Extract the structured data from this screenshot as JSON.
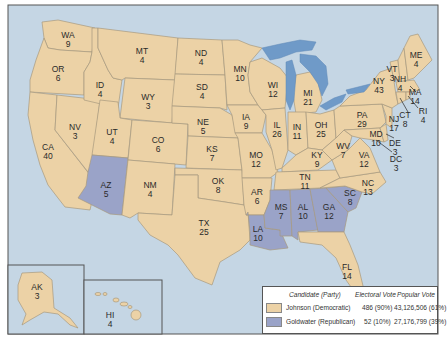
{
  "colors": {
    "ocean": "#c5d6e4",
    "democratic": "#ecd2a6",
    "republican": "#9aa3c8",
    "lakes": "#6f9ac8",
    "frame": "#555555"
  },
  "states": {
    "WA": {
      "abbr": "WA",
      "votes": "9",
      "winner": "Johnson"
    },
    "OR": {
      "abbr": "OR",
      "votes": "6",
      "winner": "Johnson"
    },
    "CA": {
      "abbr": "CA",
      "votes": "40",
      "winner": "Johnson"
    },
    "NV": {
      "abbr": "NV",
      "votes": "3",
      "winner": "Johnson"
    },
    "ID": {
      "abbr": "ID",
      "votes": "4",
      "winner": "Johnson"
    },
    "MT": {
      "abbr": "MT",
      "votes": "4",
      "winner": "Johnson"
    },
    "WY": {
      "abbr": "WY",
      "votes": "3",
      "winner": "Johnson"
    },
    "UT": {
      "abbr": "UT",
      "votes": "4",
      "winner": "Johnson"
    },
    "AZ": {
      "abbr": "AZ",
      "votes": "5",
      "winner": "Goldwater"
    },
    "CO": {
      "abbr": "CO",
      "votes": "6",
      "winner": "Johnson"
    },
    "NM": {
      "abbr": "NM",
      "votes": "4",
      "winner": "Johnson"
    },
    "ND": {
      "abbr": "ND",
      "votes": "4",
      "winner": "Johnson"
    },
    "SD": {
      "abbr": "SD",
      "votes": "4",
      "winner": "Johnson"
    },
    "NE": {
      "abbr": "NE",
      "votes": "5",
      "winner": "Johnson"
    },
    "KS": {
      "abbr": "KS",
      "votes": "7",
      "winner": "Johnson"
    },
    "OK": {
      "abbr": "OK",
      "votes": "8",
      "winner": "Johnson"
    },
    "TX": {
      "abbr": "TX",
      "votes": "25",
      "winner": "Johnson"
    },
    "MN": {
      "abbr": "MN",
      "votes": "10",
      "winner": "Johnson"
    },
    "IA": {
      "abbr": "IA",
      "votes": "9",
      "winner": "Johnson"
    },
    "MO": {
      "abbr": "MO",
      "votes": "12",
      "winner": "Johnson"
    },
    "AR": {
      "abbr": "AR",
      "votes": "6",
      "winner": "Johnson"
    },
    "LA": {
      "abbr": "LA",
      "votes": "10",
      "winner": "Goldwater"
    },
    "WI": {
      "abbr": "WI",
      "votes": "12",
      "winner": "Johnson"
    },
    "IL": {
      "abbr": "IL",
      "votes": "26",
      "winner": "Johnson"
    },
    "MI": {
      "abbr": "MI",
      "votes": "21",
      "winner": "Johnson"
    },
    "IN": {
      "abbr": "IN",
      "votes": "11",
      "winner": "Johnson"
    },
    "OH": {
      "abbr": "OH",
      "votes": "25",
      "winner": "Johnson"
    },
    "KY": {
      "abbr": "KY",
      "votes": "9",
      "winner": "Johnson"
    },
    "TN": {
      "abbr": "TN",
      "votes": "11",
      "winner": "Johnson"
    },
    "MS": {
      "abbr": "MS",
      "votes": "7",
      "winner": "Goldwater"
    },
    "AL": {
      "abbr": "AL",
      "votes": "10",
      "winner": "Goldwater"
    },
    "GA": {
      "abbr": "GA",
      "votes": "12",
      "winner": "Goldwater"
    },
    "FL": {
      "abbr": "FL",
      "votes": "14",
      "winner": "Johnson"
    },
    "SC": {
      "abbr": "SC",
      "votes": "8",
      "winner": "Goldwater"
    },
    "NC": {
      "abbr": "NC",
      "votes": "13",
      "winner": "Johnson"
    },
    "VA": {
      "abbr": "VA",
      "votes": "12",
      "winner": "Johnson"
    },
    "WV": {
      "abbr": "WV",
      "votes": "7",
      "winner": "Johnson"
    },
    "PA": {
      "abbr": "PA",
      "votes": "29",
      "winner": "Johnson"
    },
    "NY": {
      "abbr": "NY",
      "votes": "43",
      "winner": "Johnson"
    },
    "VT": {
      "abbr": "VT",
      "votes": "3",
      "winner": "Johnson"
    },
    "NH": {
      "abbr": "NH",
      "votes": "4",
      "winner": "Johnson"
    },
    "ME": {
      "abbr": "ME",
      "votes": "4",
      "winner": "Johnson"
    },
    "MA": {
      "abbr": "MA",
      "votes": "14",
      "winner": "Johnson"
    },
    "RI": {
      "abbr": "RI",
      "votes": "4",
      "winner": "Johnson"
    },
    "CT": {
      "abbr": "CT",
      "votes": "8",
      "winner": "Johnson"
    },
    "NJ": {
      "abbr": "NJ",
      "votes": "17",
      "winner": "Johnson"
    },
    "DE": {
      "abbr": "DE",
      "votes": "3",
      "winner": "Johnson"
    },
    "MD": {
      "abbr": "MD",
      "votes": "10",
      "winner": "Johnson"
    },
    "DC": {
      "abbr": "DC",
      "votes": "3",
      "winner": "Johnson"
    },
    "AK": {
      "abbr": "AK",
      "votes": "3",
      "winner": "Johnson"
    },
    "HI": {
      "abbr": "HI",
      "votes": "4",
      "winner": "Johnson"
    }
  },
  "legend": {
    "col_candidate": "Candidate (Party)",
    "col_electoral": "Electoral Vote",
    "col_popular": "Popular Vote",
    "rows": [
      {
        "candidate": "Johnson (Democratic)",
        "electoral": "486 (90%)",
        "popular": "43,126,506 (61%)",
        "color_key": "democratic"
      },
      {
        "candidate": "Goldwater (Republican)",
        "electoral": "52 (10%)",
        "popular": "27,176,799 (39%)",
        "color_key": "republican"
      }
    ]
  }
}
